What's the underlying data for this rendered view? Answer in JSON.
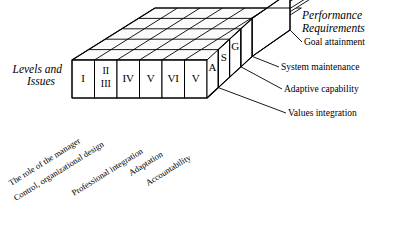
{
  "figure": {
    "type": "isometric-block-diagram",
    "left_axis_title": "Levels and\nIssues",
    "left_axis_title_line1": "Levels and",
    "left_axis_title_line2": "Issues",
    "right_axis_title_line1": "Performance",
    "right_axis_title_line2": "Requirements",
    "front_cells": [
      {
        "label": "I"
      },
      {
        "label_top": "II",
        "label_bottom": "III"
      },
      {
        "label": "IV"
      },
      {
        "label": "V"
      },
      {
        "label": "VI"
      }
    ],
    "front_cell_labels": [
      "I",
      "II",
      "III",
      "IV",
      "V",
      "VI"
    ],
    "step_cells": [
      {
        "label": "V"
      },
      {
        "label": "A"
      },
      {
        "label": "S"
      },
      {
        "label": "G"
      }
    ],
    "right_labels": [
      {
        "code": "G",
        "text": "Goal attainment"
      },
      {
        "code": "S",
        "text": "System maintenance"
      },
      {
        "code": "A",
        "text": "Adaptive capability"
      },
      {
        "code": "V",
        "text": "Values integration"
      }
    ],
    "bottom_labels": [
      "The role of the manager",
      "Control, organizational design",
      "Professional integration",
      "Adaptation",
      "Accountability"
    ],
    "grid": {
      "columns": 6,
      "rows": 4
    },
    "colors": {
      "stroke": "#000000",
      "face": "#ffffff",
      "top_face": "#fbfbfb",
      "background": "#ffffff"
    }
  }
}
